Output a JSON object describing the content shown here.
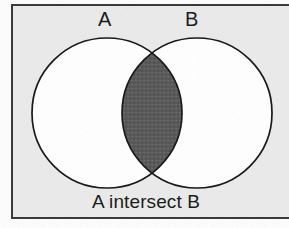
{
  "figure": {
    "type": "venn-diagram",
    "caption": "A intersect B",
    "sets": [
      {
        "id": "A",
        "label": "A"
      },
      {
        "id": "B",
        "label": "B"
      }
    ],
    "shaded_region": "intersection",
    "shaded_region_label": "A ∩ B",
    "colors": {
      "page_background": "#fbfbfb",
      "panel_background": "#e9e9e9",
      "frame_border": "#3a3a3a",
      "circle_fill": "#fdfdfd",
      "circle_stroke": "#1a1a1a",
      "intersection_fill": "#5a5a5a",
      "text": "#1c1c1c"
    },
    "geometry": {
      "circle_a": {
        "cx": 107,
        "cy": 113,
        "r": 75
      },
      "circle_b": {
        "cx": 197,
        "cy": 113,
        "r": 75
      }
    }
  }
}
